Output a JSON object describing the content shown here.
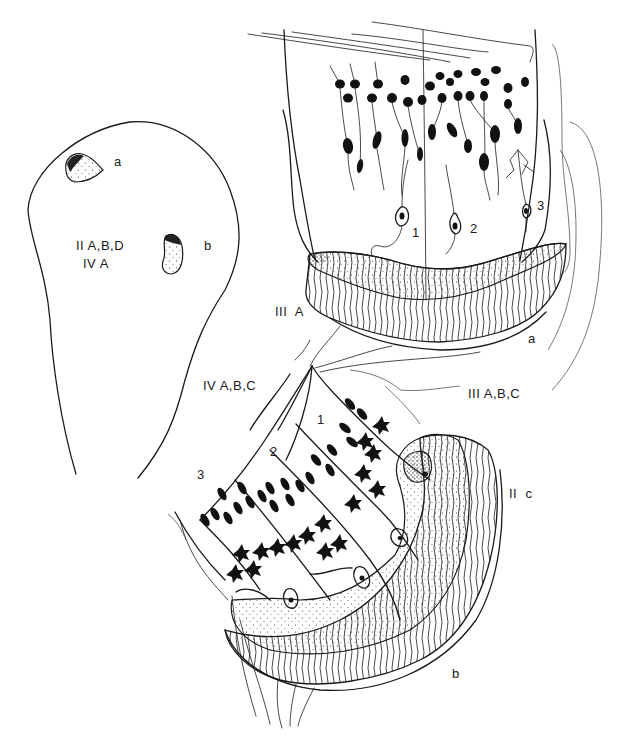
{
  "figure": {
    "type": "anatomical line drawing",
    "ink_color": "#1a1a1a",
    "background": "#ffffff"
  },
  "overview": {
    "nucleus_a_label": "a",
    "nucleus_b_label": "b",
    "region_label_line1": "II A,B,D",
    "region_label_line2": "IV A"
  },
  "upper_detail": {
    "cell_labels": [
      "1",
      "2",
      "3"
    ],
    "nucleus_label": "a",
    "tract_label": "III  A"
  },
  "connecting": {
    "left_label": "IV A,B,C",
    "right_label": "III A,B,C"
  },
  "lower_detail": {
    "cell_labels": [
      "1",
      "2",
      "3"
    ],
    "side_label": "II  c",
    "nucleus_label": "b"
  }
}
